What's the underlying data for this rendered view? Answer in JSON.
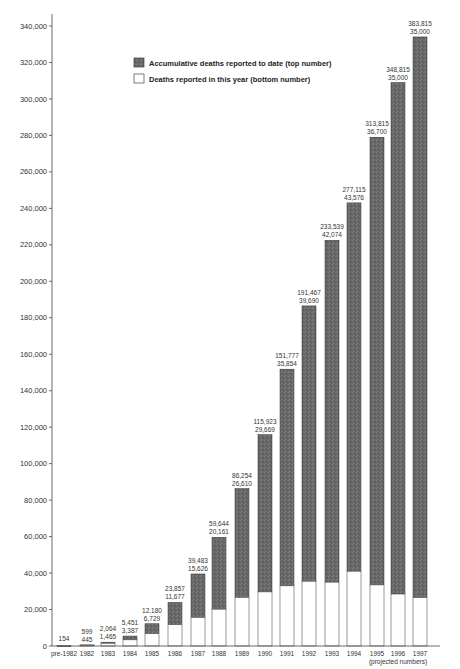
{
  "chart_data": {
    "type": "bar",
    "title": "",
    "xlabel": "",
    "ylabel": "",
    "ylim": [
      0,
      340000
    ],
    "y_ticks": [
      0,
      20000,
      40000,
      60000,
      80000,
      100000,
      120000,
      140000,
      160000,
      180000,
      200000,
      220000,
      240000,
      260000,
      280000,
      300000,
      320000,
      340000
    ],
    "y_tick_labels": [
      "0",
      "20,000",
      "40,000",
      "60,000",
      "80,000",
      "100,000",
      "120,000",
      "140,000",
      "160,000",
      "180,000",
      "200,000",
      "220,000",
      "240,000",
      "260,000",
      "280,000",
      "300,000",
      "320,000",
      "340,000"
    ],
    "grid": false,
    "legend_position": "upper-center",
    "categories": [
      "pre-1982",
      "1982",
      "1983",
      "1984",
      "1985",
      "1986",
      "1987",
      "1988",
      "1989",
      "1990",
      "1991",
      "1992",
      "1993",
      "1994",
      "1995",
      "1996",
      "1997"
    ],
    "series": [
      {
        "name": "Accumulative deaths reported to date (top number)",
        "color": "#6b6b6b",
        "values": [
          154,
          599,
          2064,
          5451,
          12180,
          23857,
          39483,
          59644,
          86254,
          115923,
          151777,
          191467,
          233539,
          277115,
          313815,
          348815,
          383815
        ],
        "labels": [
          "154",
          "599",
          "2,064",
          "5,451",
          "12,180",
          "23,857",
          "39,483",
          "59,644",
          "86,254",
          "115,923",
          "151,777",
          "191,467",
          "233,539",
          "277,115",
          "313,815",
          "348,815",
          "383,815"
        ]
      },
      {
        "name": "Deaths reported in this year (bottom number)",
        "color": "#ffffff",
        "values": [
          null,
          445,
          1465,
          3387,
          6729,
          11677,
          15626,
          20161,
          26610,
          29669,
          35854,
          39690,
          42074,
          43576,
          36700,
          35000,
          35000
        ],
        "labels": [
          "",
          "445",
          "1,465",
          "3,387",
          "6,729",
          "11,677",
          "15,626",
          "20,161",
          "26,610",
          "29,669",
          "35,854",
          "39,690",
          "42,074",
          "43,576",
          "36,700",
          "35,000",
          "35,000"
        ]
      }
    ],
    "display_height": {
      "note": "Bar heights as drawn in the source image, measured in axis units. These do not match the printed labels for several bars (e.g. 1997 is drawn near 334,000 but labeled 383,815).",
      "accumulative": [
        154,
        600,
        2100,
        5450,
        12200,
        23900,
        39500,
        59600,
        86300,
        115900,
        151800,
        186500,
        222500,
        243000,
        279000,
        309000,
        334000
      ],
      "this_year": [
        0,
        445,
        1465,
        3387,
        6729,
        11677,
        15626,
        20161,
        26610,
        29669,
        33000,
        35500,
        35000,
        41000,
        33500,
        28500,
        26500
      ]
    },
    "annotations": [
      "(projected numbers)"
    ],
    "projected_categories": [
      "1995",
      "1996",
      "1997"
    ]
  },
  "legend": {
    "items": [
      {
        "label": "Accumulative deaths reported to date (top number)",
        "swatch": "#666666"
      },
      {
        "label": "Deaths reported in this year (bottom number)",
        "swatch": "#ffffff"
      }
    ]
  },
  "x_note": "(projected numbers)"
}
